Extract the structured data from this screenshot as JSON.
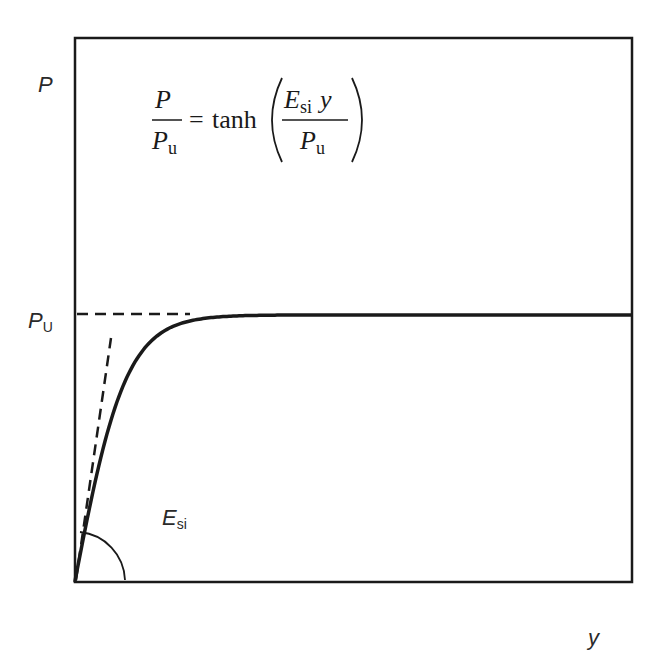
{
  "diagram": {
    "type": "load-deflection curve (hyperbolic tangent)",
    "y_axis_label": "P",
    "x_axis_label": "y",
    "asymptote_label": {
      "main": "P",
      "sub": "U"
    },
    "slope_label": {
      "main": "E",
      "sub": "si"
    },
    "equation": {
      "lhs_numerator": "P",
      "lhs_denominator": {
        "main": "P",
        "sub": "u"
      },
      "equals": "=",
      "function": "tanh",
      "arg_numerator": {
        "main": "E",
        "sub": "si",
        "var": "y"
      },
      "arg_denominator": {
        "main": "P",
        "sub": "u"
      }
    },
    "curve": {
      "formula": "P = Pu * tanh(Esi * y / Pu)",
      "Pu_fraction_of_axis": 0.49,
      "saturation_y_fraction": 0.24
    },
    "colors": {
      "line": "#1a1a1a",
      "text": "#2a2a2a",
      "background": "#ffffff"
    }
  }
}
